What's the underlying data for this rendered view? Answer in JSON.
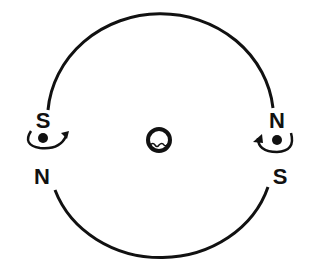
{
  "diagram": {
    "type": "magnetic-orbit-diagram",
    "colors": {
      "stroke": "#111111",
      "background": "#ffffff"
    },
    "center_body": {
      "icon": "ring-body-icon"
    },
    "left_magnet": {
      "top_label": "S",
      "bottom_label": "N",
      "rotation": "clockwise-arrow-right"
    },
    "right_magnet": {
      "top_label": "N",
      "bottom_label": "S",
      "rotation": "arrow-left"
    }
  }
}
